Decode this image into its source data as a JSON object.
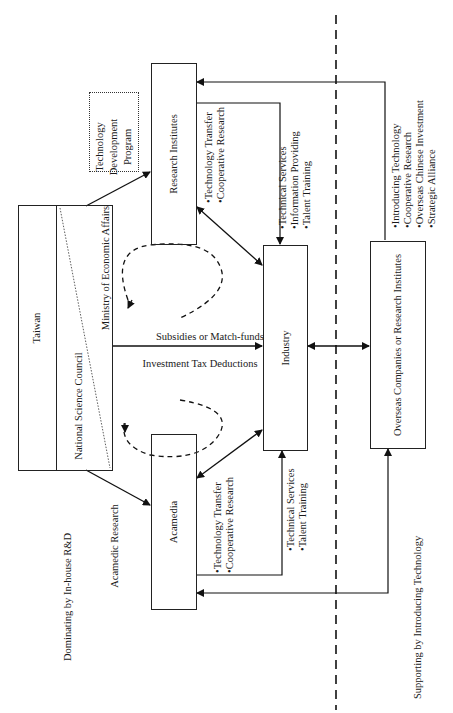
{
  "diagram": {
    "orientation": "rotated-90-ccw",
    "nodes": {
      "taiwan": "Taiwan",
      "nsc": "National Science Council",
      "moea": "Ministry of Economic Affairs",
      "tdp_line1": "Technology",
      "tdp_line2": "Development",
      "tdp_line3": "Program",
      "research_institutes": "Research Institutes",
      "acamedia": "Acamedia",
      "industry": "Industry",
      "overseas": "Overseas Companies or Research Institutes"
    },
    "edge_labels": {
      "subsidies": "Subsidies or Match-funds",
      "tax": "Investment Tax Deductions",
      "acamedic_research": "Acamedic Research",
      "ri_to_ind": [
        "•Technology Transfer",
        "•Cooperative Research"
      ],
      "ind_to_ri": [
        "•Technical Services",
        "•Information Providing",
        "•Talent Training"
      ],
      "aca_to_ind": [
        "•Technology Transfer",
        "•Cooperative Research"
      ],
      "ind_to_aca": [
        "•Technical Services",
        "•Talent Training"
      ],
      "overseas_services": [
        "•Introducing Technology",
        "•Cooperative Research",
        "•Overseas Chinese Investment",
        "•Strategic Alliance"
      ]
    },
    "region_labels": {
      "left": "Dominating by In-house R&D",
      "right": "Supporting by Introducing Technology"
    }
  }
}
